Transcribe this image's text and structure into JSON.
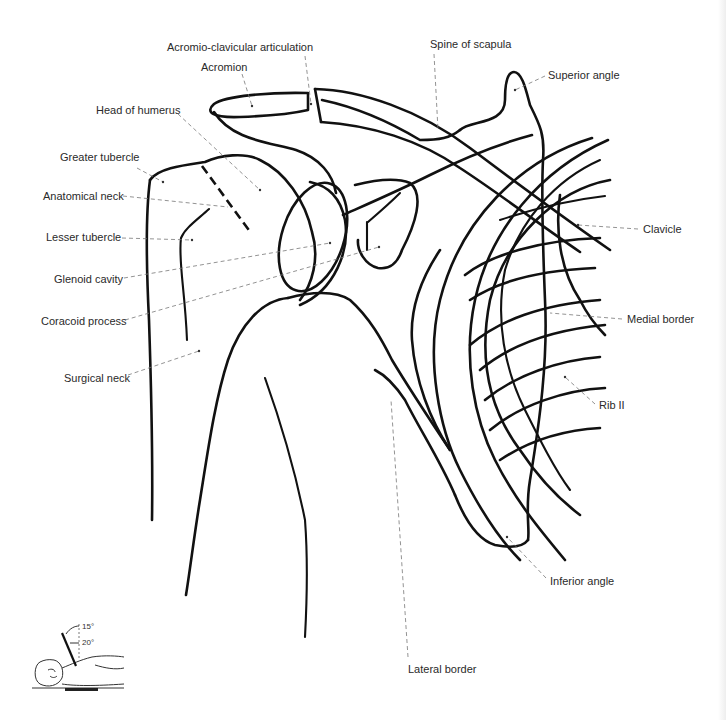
{
  "diagram": {
    "labels": {
      "acromio_clavicular": "Acromio-clavicular articulation",
      "acromion": "Acromion",
      "spine_of_scapula": "Spine of scapula",
      "superior_angle": "Superior angle",
      "head_of_humerus": "Head of humerus",
      "greater_tubercle": "Greater tubercle",
      "anatomical_neck": "Anatomical neck",
      "lesser_tubercle": "Lesser tubercle",
      "glenoid_cavity": "Glenoid cavity",
      "coracoid_process": "Coracoid process",
      "surgical_neck": "Surgical neck",
      "clavicle": "Clavicle",
      "medial_border": "Medial border",
      "rib_ii": "Rib II",
      "inferior_angle": "Inferior angle",
      "lateral_border": "Lateral border"
    },
    "inset": {
      "description": "Patient positioning: supine, tube angled",
      "angle_1": "15°",
      "angle_2": "20°"
    }
  }
}
